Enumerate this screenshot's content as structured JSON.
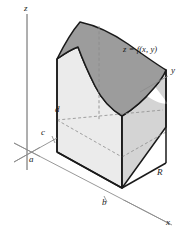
{
  "figure": {
    "surface_label": "z = f(x, y)",
    "axes": {
      "z": "z",
      "y": "y",
      "x": "x"
    },
    "marks": {
      "a": "a",
      "b": "b",
      "c": "c",
      "d": "d",
      "region": "R"
    },
    "colors": {
      "surface_top": "#9a9a9a",
      "front_face": "#ededed",
      "side_face": "#d6d6d6",
      "outline": "#1a1a1a",
      "axis": "#8c8c8c",
      "dashed": "#8c8c8c",
      "background": "#ffffff"
    }
  }
}
